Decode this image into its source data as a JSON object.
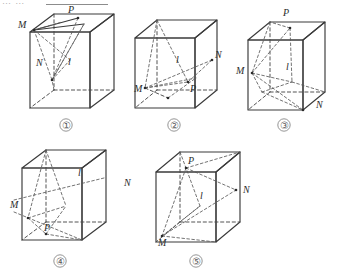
{
  "header": {
    "fragment_text": "…  …",
    "note": "partially cropped text row at top edge"
  },
  "figure": {
    "caption_labels": [
      "①",
      "②",
      "③",
      "④",
      "⑤"
    ],
    "point_labels": [
      "M",
      "N",
      "P"
    ],
    "line_label": "l",
    "colors": {
      "stroke_solid": "#3a3a3a",
      "stroke_dashed": "#4a4a4a",
      "label_text": "#2b2b2b",
      "number_text": "#5a5a5a",
      "background": "#ffffff"
    },
    "cubes": [
      {
        "id": "cube-1",
        "number": "①",
        "labels": [
          {
            "name": "M",
            "x": 22,
            "y": 24
          },
          {
            "name": "P",
            "x": 70,
            "y": 12
          },
          {
            "name": "N",
            "x": 38,
            "y": 63
          },
          {
            "name": "l",
            "x": 67,
            "y": 62
          }
        ]
      },
      {
        "id": "cube-2",
        "number": "②",
        "labels": [
          {
            "name": "l",
            "x": 177,
            "y": 62
          },
          {
            "name": "N",
            "x": 216,
            "y": 57
          },
          {
            "name": "M",
            "x": 139,
            "y": 90
          },
          {
            "name": "P",
            "x": 192,
            "y": 90
          }
        ]
      },
      {
        "id": "cube-3",
        "number": "③",
        "labels": [
          {
            "name": "P",
            "x": 285,
            "y": 14
          },
          {
            "name": "M",
            "x": 238,
            "y": 70
          },
          {
            "name": "l",
            "x": 286,
            "y": 68
          },
          {
            "name": "N",
            "x": 320,
            "y": 104
          }
        ]
      },
      {
        "id": "cube-4",
        "number": "④",
        "labels": [
          {
            "name": "l",
            "x": 80,
            "y": 172
          },
          {
            "name": "N",
            "x": 128,
            "y": 183
          },
          {
            "name": "M",
            "x": 15,
            "y": 205
          },
          {
            "name": "P",
            "x": 48,
            "y": 228
          }
        ]
      },
      {
        "id": "cube-5",
        "number": "⑤",
        "labels": [
          {
            "name": "P",
            "x": 186,
            "y": 162
          },
          {
            "name": "N",
            "x": 247,
            "y": 190
          },
          {
            "name": "l",
            "x": 201,
            "y": 196
          },
          {
            "name": "M",
            "x": 160,
            "y": 240
          }
        ]
      }
    ]
  }
}
